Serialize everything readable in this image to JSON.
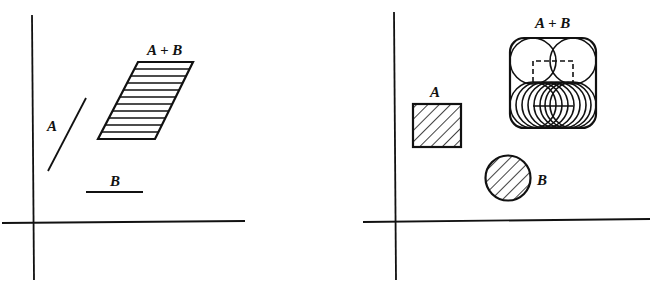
{
  "left_panel": {
    "label_a": "A",
    "label_b": "B",
    "label_sum": "A + B",
    "description": "Minkowski sum of two line segments forms a parallelogram"
  },
  "right_panel": {
    "label_a": "A",
    "label_b": "B",
    "label_sum": "A + B",
    "description": "Minkowski sum of a square and a disk forms a rounded square"
  },
  "colors": {
    "ink": "#111111",
    "background": "#ffffff"
  }
}
